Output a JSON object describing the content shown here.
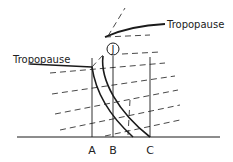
{
  "diagram": {
    "labels": {
      "tropopause_upper": "Tropopause",
      "tropopause_lower": "Tropopause",
      "jet": "J",
      "station_a": "A",
      "station_b": "B",
      "station_c": "C"
    },
    "colors": {
      "ink": "#1a1a1a",
      "background": "#ffffff"
    }
  }
}
